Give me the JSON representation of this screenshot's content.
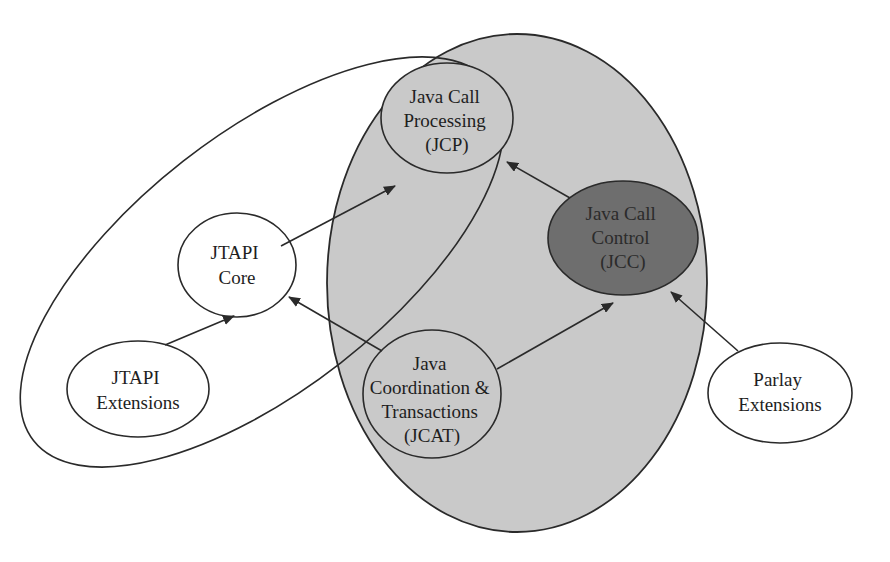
{
  "diagram": {
    "type": "api-relationship-diagram",
    "colors": {
      "background": "#ffffff",
      "group_fill": "#c9c9c9",
      "highlight_fill": "#6e6e6e",
      "node_fill": "#ffffff",
      "stroke": "#2a2a2a"
    },
    "nodes": {
      "jcp": {
        "lines": [
          "Java Call",
          "Processing",
          "(JCP)"
        ]
      },
      "jcc": {
        "lines": [
          "Java Call",
          "Control",
          "(JCC)"
        ]
      },
      "jtapi_core": {
        "lines": [
          "JTAPI",
          "Core"
        ]
      },
      "jtapi_ext": {
        "lines": [
          "JTAPI",
          "Extensions"
        ]
      },
      "jcat": {
        "lines": [
          "Java",
          "Coordination &",
          "Transactions",
          "(JCAT)"
        ]
      },
      "parlay_ext": {
        "lines": [
          "Parlay",
          "Extensions"
        ]
      }
    },
    "edges": [
      {
        "from": "JTAPI Extensions",
        "to": "JTAPI Core"
      },
      {
        "from": "JTAPI Core",
        "to": "Java Call Processing (JCP)"
      },
      {
        "from": "Java Call Control (JCC)",
        "to": "Java Call Processing (JCP)"
      },
      {
        "from": "Java Coordination & Transactions (JCAT)",
        "to": "JTAPI Core"
      },
      {
        "from": "Java Coordination & Transactions (JCAT)",
        "to": "Java Call Control (JCC)"
      },
      {
        "from": "Parlay Extensions",
        "to": "Java Call Control (JCC)"
      }
    ],
    "groups": [
      {
        "name": "shaded-group",
        "contains": [
          "JCP",
          "JCC",
          "JCAT"
        ]
      },
      {
        "name": "jtapi-loop",
        "contains": [
          "JTAPI Core",
          "JTAPI Extensions",
          "JCP"
        ]
      }
    ]
  }
}
